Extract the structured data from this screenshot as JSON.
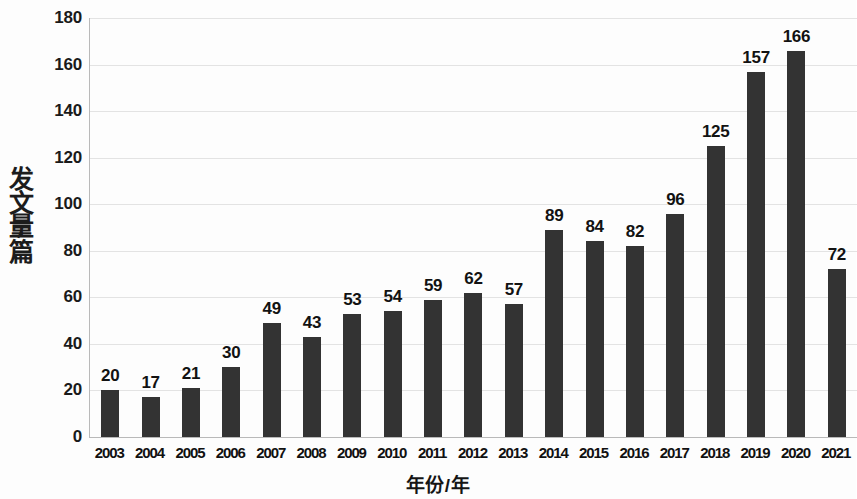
{
  "chart_data": {
    "type": "bar",
    "title": "",
    "xlabel": "年份/年",
    "ylabel": "发文量/篇",
    "categories": [
      "2003",
      "2004",
      "2005",
      "2006",
      "2007",
      "2008",
      "2009",
      "2010",
      "2011",
      "2012",
      "2013",
      "2014",
      "2015",
      "2016",
      "2017",
      "2018",
      "2019",
      "2020",
      "2021"
    ],
    "values": [
      20,
      17,
      21,
      30,
      49,
      43,
      53,
      54,
      59,
      62,
      57,
      89,
      84,
      82,
      96,
      125,
      157,
      166,
      72
    ],
    "ylim": [
      0,
      180
    ],
    "ytick_labels": [
      "180",
      "160",
      "140",
      "120",
      "100",
      "80",
      "60",
      "40",
      "20",
      "0"
    ],
    "ytick_values": [
      180,
      160,
      140,
      120,
      100,
      80,
      60,
      40,
      20,
      0
    ],
    "grid": true,
    "legend": false,
    "data_labels": true,
    "bar_color": "#333333",
    "gridline_color": "#e3e3e3",
    "axis_color": "#b9b9b9"
  },
  "y_axis_title_chars": [
    "发",
    "文",
    "量"
  ],
  "y_axis_title_unit": "篇",
  "y_axis_title_separator": "/"
}
